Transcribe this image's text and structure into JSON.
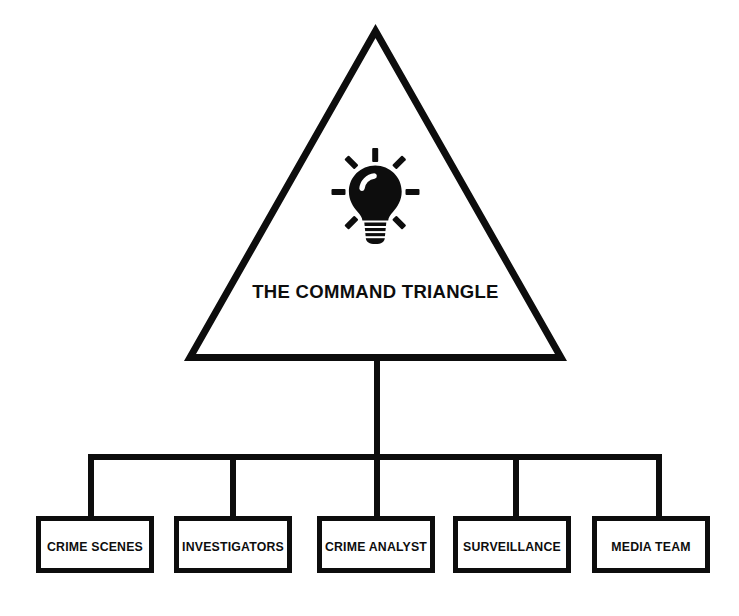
{
  "diagram": {
    "type": "org-chart",
    "title": "THE COMMAND TRIANGLE",
    "root": {
      "shape": "triangle",
      "label": "THE COMMAND TRIANGLE",
      "icon": "lightbulb-icon"
    },
    "children": [
      {
        "label": "CRIME SCENES"
      },
      {
        "label": "INVESTIGATORS"
      },
      {
        "label": "CRIME ANALYST"
      },
      {
        "label": "SURVEILLANCE"
      },
      {
        "label": "MEDIA TEAM"
      }
    ],
    "colors": {
      "background": "#ffffff",
      "stroke": "#0d0d0d",
      "fill": "#ffffff",
      "icon": "#0d0d0d"
    }
  }
}
